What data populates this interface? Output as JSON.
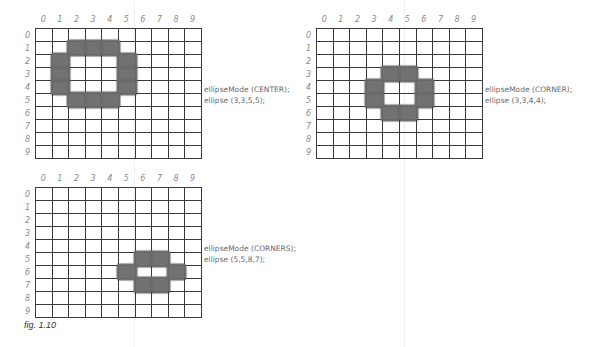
{
  "figure": {
    "caption": "fig. 1.10",
    "column_labels": [
      "0",
      "1",
      "2",
      "3",
      "4",
      "5",
      "6",
      "7",
      "8",
      "9"
    ],
    "row_labels": [
      "0",
      "1",
      "2",
      "3",
      "4",
      "5",
      "6",
      "7",
      "8",
      "9"
    ],
    "mark_color": "#6b6b6b",
    "grid_line_color": "#3a3a3a",
    "panels": [
      {
        "mode_line": "ellipseMode (CENTER);",
        "call_line": "ellipse (3,3,5,5);",
        "filled_cells": [
          [
            1,
            2
          ],
          [
            1,
            3
          ],
          [
            1,
            4
          ],
          [
            2,
            1
          ],
          [
            3,
            1
          ],
          [
            4,
            1
          ],
          [
            2,
            5
          ],
          [
            3,
            5
          ],
          [
            4,
            5
          ],
          [
            5,
            2
          ],
          [
            5,
            3
          ],
          [
            5,
            4
          ]
        ]
      },
      {
        "mode_line": "ellipseMode (CORNER);",
        "call_line": "ellipse (3,3,4,4);",
        "filled_cells": [
          [
            3,
            4
          ],
          [
            3,
            5
          ],
          [
            4,
            3
          ],
          [
            5,
            3
          ],
          [
            4,
            6
          ],
          [
            5,
            6
          ],
          [
            6,
            4
          ],
          [
            6,
            5
          ]
        ]
      },
      {
        "mode_line": "ellipseMode (CORNERS);",
        "call_line": "ellipse (5,5,8,7);",
        "filled_cells": [
          [
            5,
            6
          ],
          [
            5,
            7
          ],
          [
            6,
            5
          ],
          [
            6,
            8
          ],
          [
            7,
            6
          ],
          [
            7,
            7
          ]
        ]
      }
    ]
  }
}
